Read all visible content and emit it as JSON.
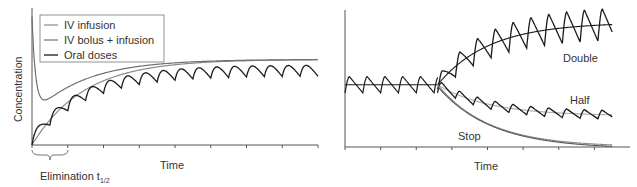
{
  "chart_data": [
    {
      "type": "line",
      "title": "",
      "xlabel": "Time",
      "ylabel": "Concentration",
      "annotation": "Elimination t1/2",
      "grid": false,
      "legend_position": "upper-left",
      "xlim": [
        0,
        8
      ],
      "ylim": [
        0,
        1.6
      ],
      "x_ticks_halflives": [
        0,
        1,
        2,
        3,
        4,
        5,
        6,
        7,
        8
      ],
      "series": [
        {
          "name": "IV infusion",
          "color": "#909090",
          "shape": "rises exponentially from 0 to steady state ~1.0 over ~5 half-lives"
        },
        {
          "name": "IV bolus + infusion",
          "color": "#707070",
          "shape": "starts high (~1.5), dips to ~0.35 near t=0.3, then rises to steady state ~1.0"
        },
        {
          "name": "Oral doses",
          "color": "#1a1a1a",
          "shape": "sawtooth rising to steady state oscillating around ~1.0 (peak ~1.12, trough ~0.88)",
          "dose_interval_halflives": 0.5
        }
      ]
    },
    {
      "type": "line",
      "title": "",
      "xlabel": "Time",
      "ylabel": "",
      "grid": false,
      "xlim": [
        0,
        8
      ],
      "ylim": [
        0,
        2.2
      ],
      "x_ticks_halflives": [
        0,
        1,
        2,
        3,
        4,
        5,
        6,
        7
      ],
      "series": [
        {
          "name": "Steady state (initial)",
          "color": "#1a1a1a",
          "level": 1.0,
          "until_halflives": 2.6
        },
        {
          "name": "Double",
          "color": "#1a1a1a",
          "shape": "rises from 1.0 toward 2.0 after dose change",
          "final_level": 2.0
        },
        {
          "name": "Half",
          "color": "#1a1a1a",
          "shape": "falls from 1.0 toward 0.5",
          "final_level": 0.5
        },
        {
          "name": "Stop",
          "color": "#888888",
          "shape": "exponential decay from 1.0 toward 0",
          "final_level": 0
        }
      ],
      "annotations": [
        "Double",
        "Half",
        "Stop"
      ]
    }
  ],
  "left": {
    "legend": [
      "IV infusion",
      "IV bolus + infusion",
      "Oral doses"
    ],
    "ylabel": "Concentration",
    "xlabel": "Time",
    "brace_label": "Elimination t",
    "brace_sub": "1/2"
  },
  "right": {
    "xlabel": "Time",
    "label_double": "Double",
    "label_half": "Half",
    "label_stop": "Stop"
  }
}
